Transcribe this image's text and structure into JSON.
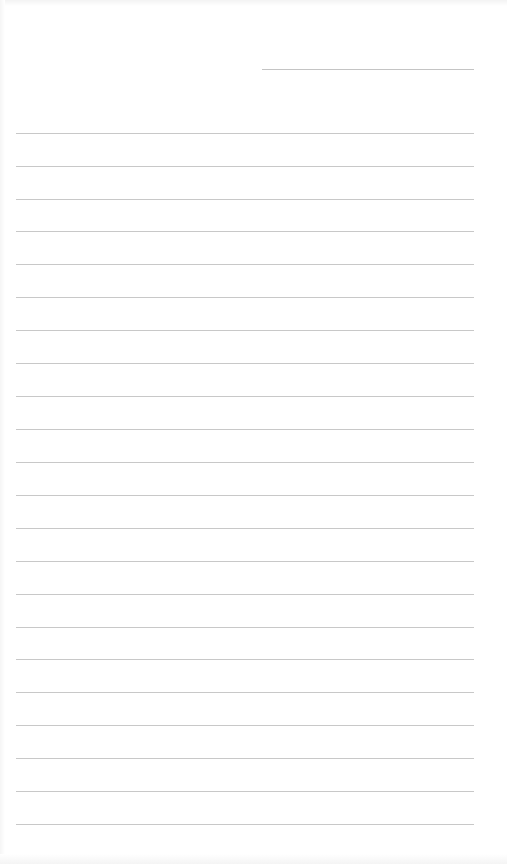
{
  "page": {
    "type": "lined-paper",
    "background_color": "#ffffff",
    "line_color": "#c8c8c8"
  },
  "date_field": {
    "value": ""
  },
  "lines": [
    {
      "y": 133,
      "text": ""
    },
    {
      "y": 166,
      "text": ""
    },
    {
      "y": 199,
      "text": ""
    },
    {
      "y": 231,
      "text": ""
    },
    {
      "y": 264,
      "text": ""
    },
    {
      "y": 297,
      "text": ""
    },
    {
      "y": 330,
      "text": ""
    },
    {
      "y": 363,
      "text": ""
    },
    {
      "y": 396,
      "text": ""
    },
    {
      "y": 429,
      "text": ""
    },
    {
      "y": 462,
      "text": ""
    },
    {
      "y": 495,
      "text": ""
    },
    {
      "y": 528,
      "text": ""
    },
    {
      "y": 561,
      "text": ""
    },
    {
      "y": 594,
      "text": ""
    },
    {
      "y": 627,
      "text": ""
    },
    {
      "y": 659,
      "text": ""
    },
    {
      "y": 692,
      "text": ""
    },
    {
      "y": 725,
      "text": ""
    },
    {
      "y": 758,
      "text": ""
    },
    {
      "y": 791,
      "text": ""
    },
    {
      "y": 824,
      "text": ""
    }
  ]
}
